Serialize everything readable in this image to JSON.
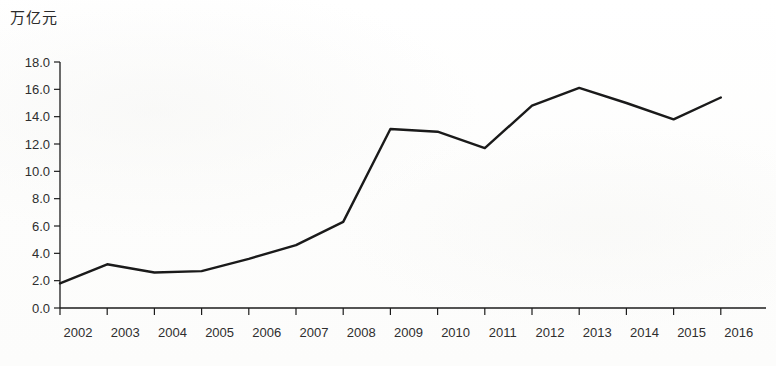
{
  "chart_data": {
    "type": "line",
    "title": "",
    "subtitle": "",
    "unit_label": "万亿元",
    "xlabel": "",
    "ylabel": "万亿元",
    "categories": [
      "2002",
      "2003",
      "2004",
      "2005",
      "2006",
      "2007",
      "2008",
      "2009",
      "2010",
      "2011",
      "2012",
      "2013",
      "2014",
      "2015",
      "2016"
    ],
    "x": [
      2002,
      2003,
      2004,
      2005,
      2006,
      2007,
      2008,
      2009,
      2010,
      2011,
      2012,
      2013,
      2014,
      2015,
      2016
    ],
    "values": [
      1.8,
      3.2,
      2.6,
      2.7,
      3.6,
      4.6,
      6.3,
      13.1,
      12.9,
      11.7,
      14.8,
      16.1,
      15.0,
      13.8,
      15.4
    ],
    "series": [
      {
        "name": "",
        "values": [
          1.8,
          3.2,
          2.6,
          2.7,
          3.6,
          4.6,
          6.3,
          13.1,
          12.9,
          11.7,
          14.8,
          16.1,
          15.0,
          13.8,
          15.4
        ]
      }
    ],
    "ylim": [
      0.0,
      18.0
    ],
    "ytick_step": 2.0,
    "ytick_labels": [
      "0.0",
      "2.0",
      "4.0",
      "6.0",
      "8.0",
      "10.0",
      "12.0",
      "14.0",
      "16.0",
      "18.0"
    ],
    "ytick_values": [
      0.0,
      2.0,
      4.0,
      6.0,
      8.0,
      10.0,
      12.0,
      14.0,
      16.0,
      18.0
    ],
    "grid": false,
    "legend": null,
    "legend_position": "none",
    "line_color": "#1a1a1a",
    "axis_color": "#1c1c1c",
    "background_color": "#fefefe",
    "annotations": []
  }
}
